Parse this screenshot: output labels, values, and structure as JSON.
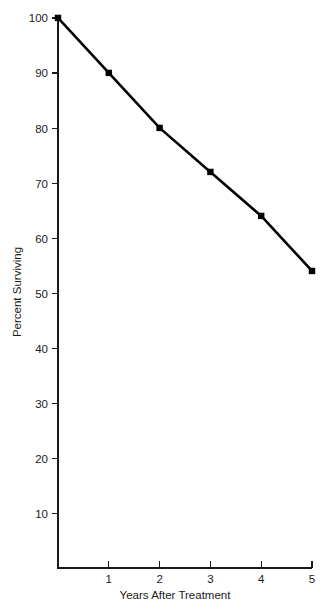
{
  "chart_data": {
    "type": "line",
    "title": "",
    "subtitle": "",
    "xlabel": "Years After Treatment",
    "ylabel": "Percent Surviving",
    "x": [
      0,
      1,
      2,
      3,
      4,
      5
    ],
    "values": [
      100,
      90,
      80,
      72,
      64,
      54
    ],
    "series": [
      {
        "name": "Percent Surviving",
        "values": [
          100,
          90,
          80,
          72,
          64,
          54
        ]
      }
    ],
    "xlim": [
      0,
      5
    ],
    "ylim": [
      0,
      100
    ],
    "xticks": [
      1,
      2,
      3,
      4,
      5
    ],
    "xticklabels": [
      "1",
      "2",
      "3",
      "4",
      "5"
    ],
    "yticks": [
      10,
      20,
      30,
      40,
      50,
      60,
      70,
      80,
      90,
      100
    ],
    "yticklabels": [
      "10",
      "20",
      "30",
      "40",
      "50",
      "60",
      "70",
      "80",
      "90",
      "100"
    ],
    "grid": false,
    "legend": false,
    "legend_position": "none",
    "marker": "square",
    "line_color": "#000000",
    "marker_color": "#000000",
    "background_color": "#ffffff",
    "annotations": []
  },
  "axes": {
    "y_title": "Percent Surviving",
    "x_title": "Years After Treatment"
  },
  "labels": {
    "y_100": "100",
    "y_90": "90",
    "y_80": "80",
    "y_70": "70",
    "y_60": "60",
    "y_50": "50",
    "y_40": "40",
    "y_30": "30",
    "y_20": "20",
    "y_10": "10",
    "x_1": "1",
    "x_2": "2",
    "x_3": "3",
    "x_4": "4",
    "x_5": "5"
  }
}
